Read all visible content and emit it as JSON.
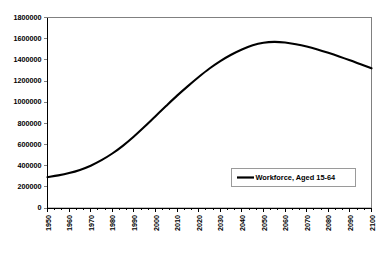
{
  "chart_data": {
    "type": "line",
    "title": "",
    "subtitle": "",
    "xlabel": "",
    "ylabel": "",
    "xlim": [
      1950,
      2100
    ],
    "ylim": [
      0,
      1800000
    ],
    "grid": false,
    "legend_position": "inside-bottom-right",
    "x_tick_labels": [
      "1950",
      "1960",
      "1970",
      "1980",
      "1990",
      "2000",
      "2010",
      "2020",
      "2030",
      "2040",
      "2050",
      "2060",
      "2070",
      "2080",
      "2090",
      "2100"
    ],
    "y_tick_labels": [
      "0",
      "200000",
      "400000",
      "600000",
      "800000",
      "1000000",
      "1200000",
      "1400000",
      "1600000",
      "1800000"
    ],
    "y_tick_values": [
      0,
      200000,
      400000,
      600000,
      800000,
      1000000,
      1200000,
      1400000,
      1600000,
      1800000
    ],
    "minor_x_ticks_per_decade": 2,
    "series": [
      {
        "name": "Workforce, Aged 15-64",
        "color": "#000000",
        "x": [
          1950,
          1955,
          1960,
          1965,
          1970,
          1975,
          1980,
          1985,
          1990,
          1995,
          2000,
          2005,
          2010,
          2015,
          2020,
          2025,
          2030,
          2035,
          2040,
          2045,
          2050,
          2055,
          2060,
          2065,
          2070,
          2075,
          2080,
          2085,
          2090,
          2095,
          2100
        ],
        "values": [
          292000,
          308000,
          330000,
          360000,
          400000,
          452000,
          515000,
          590000,
          676000,
          770000,
          868000,
          966000,
          1062000,
          1152000,
          1238000,
          1318000,
          1388000,
          1448000,
          1498000,
          1538000,
          1562000,
          1570000,
          1564000,
          1548000,
          1526000,
          1498000,
          1466000,
          1432000,
          1396000,
          1358000,
          1320000
        ]
      }
    ],
    "annotations": {
      "peak_year": 2055,
      "peak_value": 1570000,
      "start_year": 1950,
      "start_value": 292000,
      "end_year": 2100,
      "end_value": 1320000
    }
  },
  "legend": {
    "entries": [
      {
        "label": "Workforce, Aged 15-64",
        "color": "#000000"
      }
    ]
  },
  "colors": {
    "series": "#000000",
    "frame": "#808080",
    "axis": "#000000",
    "background": "#ffffff"
  }
}
